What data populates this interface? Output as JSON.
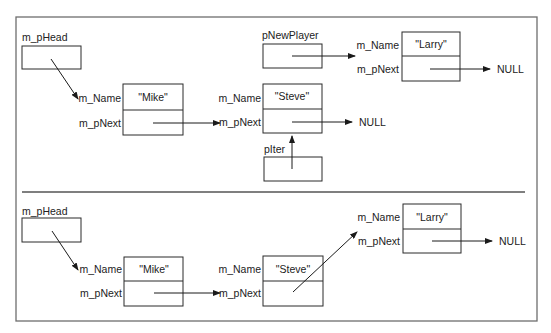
{
  "diagram": {
    "panels": [
      {
        "id": "before",
        "head_label": "m_pHead",
        "new_player_label": "pNewPlayer",
        "iter_label": "pIter",
        "nodes": [
          {
            "name_label": "m_Name",
            "next_label": "m_pNext",
            "value": "\"Mike\""
          },
          {
            "name_label": "m_Name",
            "next_label": "m_pNext",
            "value": "\"Steve\"",
            "next": "NULL"
          },
          {
            "name_label": "m_Name",
            "next_label": "m_pNext",
            "value": "\"Larry\"",
            "next": "NULL"
          }
        ]
      },
      {
        "id": "after",
        "head_label": "m_pHead",
        "nodes": [
          {
            "name_label": "m_Name",
            "next_label": "m_pNext",
            "value": "\"Mike\""
          },
          {
            "name_label": "m_Name",
            "next_label": "m_pNext",
            "value": "\"Steve\""
          },
          {
            "name_label": "m_Name",
            "next_label": "m_pNext",
            "value": "\"Larry\"",
            "next": "NULL"
          }
        ]
      }
    ]
  }
}
